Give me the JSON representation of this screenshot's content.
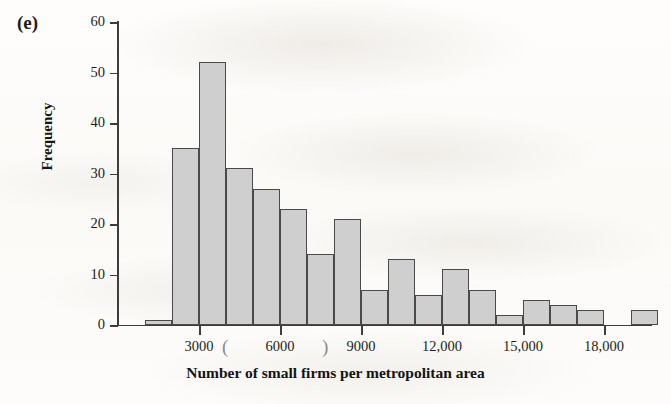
{
  "figure": {
    "panel_label": "(e)",
    "background_color": "#fdfcfa"
  },
  "chart_data": {
    "type": "bar",
    "title": "",
    "subtitle": "",
    "xlabel": "Number of small firms per metropolitan area",
    "ylabel": "Frequency",
    "grid": false,
    "legend": null,
    "bar_fill_color": "#cfcfcf",
    "bar_edge_color": "#4a4a4a",
    "xlim": [
      0,
      20000
    ],
    "ylim": [
      0,
      60
    ],
    "bin_width": 1000,
    "x_tick_values": [
      3000,
      6000,
      9000,
      12000,
      15000,
      18000
    ],
    "x_tick_labels": [
      "3000",
      "6000",
      "9000",
      "12,000",
      "15,000",
      "18,000"
    ],
    "y_tick_values": [
      0,
      10,
      20,
      30,
      40,
      50,
      60
    ],
    "y_tick_labels": [
      "0",
      "10",
      "20",
      "30",
      "40",
      "50",
      "60"
    ],
    "bins": [
      {
        "start": 1000,
        "end": 2000,
        "value": 1
      },
      {
        "start": 2000,
        "end": 3000,
        "value": 35
      },
      {
        "start": 3000,
        "end": 4000,
        "value": 52
      },
      {
        "start": 4000,
        "end": 5000,
        "value": 31
      },
      {
        "start": 5000,
        "end": 6000,
        "value": 27
      },
      {
        "start": 6000,
        "end": 7000,
        "value": 23
      },
      {
        "start": 7000,
        "end": 8000,
        "value": 14
      },
      {
        "start": 8000,
        "end": 9000,
        "value": 21
      },
      {
        "start": 9000,
        "end": 10000,
        "value": 7
      },
      {
        "start": 10000,
        "end": 11000,
        "value": 13
      },
      {
        "start": 11000,
        "end": 12000,
        "value": 6
      },
      {
        "start": 12000,
        "end": 13000,
        "value": 11
      },
      {
        "start": 13000,
        "end": 14000,
        "value": 7
      },
      {
        "start": 14000,
        "end": 15000,
        "value": 2
      },
      {
        "start": 15000,
        "end": 16000,
        "value": 5
      },
      {
        "start": 16000,
        "end": 17000,
        "value": 4
      },
      {
        "start": 17000,
        "end": 18000,
        "value": 3
      },
      {
        "start": 18000,
        "end": 19000,
        "value": 0
      },
      {
        "start": 19000,
        "end": 20000,
        "value": 3
      }
    ],
    "categories": [
      "1000-2000",
      "2000-3000",
      "3000-4000",
      "4000-5000",
      "5000-6000",
      "6000-7000",
      "7000-8000",
      "8000-9000",
      "9000-10,000",
      "10,000-11,000",
      "11,000-12,000",
      "12,000-13,000",
      "13,000-14,000",
      "14,000-15,000",
      "15,000-16,000",
      "16,000-17,000",
      "17,000-18,000",
      "18,000-19,000",
      "19,000-20,000"
    ],
    "values": [
      1,
      35,
      52,
      31,
      27,
      23,
      14,
      21,
      7,
      13,
      6,
      11,
      7,
      2,
      5,
      4,
      3,
      0,
      3
    ]
  },
  "scan_artifacts": [
    {
      "mark": "(",
      "x": 222,
      "y": 336
    },
    {
      "mark": ")",
      "x": 322,
      "y": 336
    }
  ]
}
